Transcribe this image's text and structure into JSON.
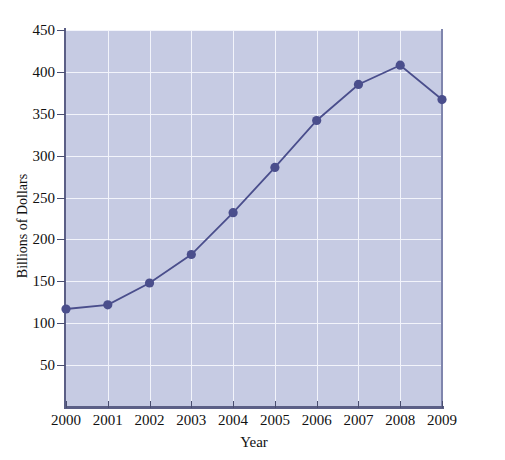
{
  "figure": {
    "top_cut_text": "",
    "background_color": "#ffffff",
    "plot_background_color": "#c6cbe3",
    "gridline_color": "#f2f4fb",
    "series_color": "#4a4e8c",
    "axis_color": "#5b5f86"
  },
  "chart_data": {
    "type": "line",
    "title": "",
    "xlabel": "Year",
    "ylabel": "Billions of Dollars",
    "x": [
      2000,
      2001,
      2002,
      2003,
      2004,
      2005,
      2006,
      2007,
      2008,
      2009
    ],
    "xtick_labels": [
      "2000",
      "2001",
      "2002",
      "2003",
      "2004",
      "2005",
      "2006",
      "2007",
      "2008",
      "2009"
    ],
    "values": [
      117,
      122,
      148,
      182,
      232,
      286,
      342,
      385,
      408,
      367
    ],
    "ytick_labels": [
      "50",
      "100",
      "150",
      "200",
      "250",
      "300",
      "350",
      "400",
      "450"
    ],
    "yticks": [
      50,
      100,
      150,
      200,
      250,
      300,
      350,
      400,
      450
    ],
    "ylim": [
      0,
      450
    ],
    "xlim": [
      2000,
      2009
    ],
    "grid": true,
    "legend": "none",
    "marker": "circle",
    "series": [
      {
        "name": "Billions of Dollars",
        "values": [
          117,
          122,
          148,
          182,
          232,
          286,
          342,
          385,
          408,
          367
        ]
      }
    ]
  }
}
